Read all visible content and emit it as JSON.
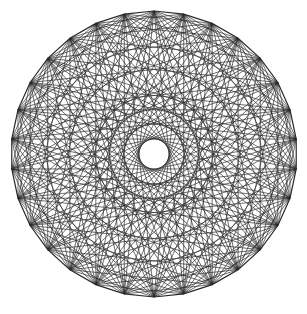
{
  "figure": {
    "background": "#ffffff",
    "stroke_color": "#2a2a2a",
    "center": [
      154,
      154
    ],
    "radius": 143,
    "points": 30,
    "chord_steps": [
      3,
      5,
      7,
      9,
      11,
      12,
      13,
      14
    ],
    "stroke_width": 0.8,
    "rotation_deg": -90
  }
}
